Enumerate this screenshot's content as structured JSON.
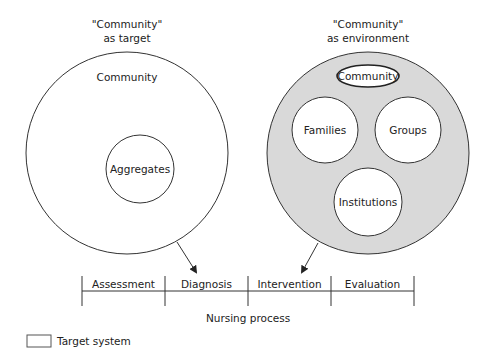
{
  "left_panel": {
    "heading_line1": "\"Community\"",
    "heading_line2": "as target",
    "outer_label": "Community",
    "inner_label": "Aggregates"
  },
  "right_panel": {
    "heading_line1": "\"Community\"",
    "heading_line2": "as environment",
    "community_label": "Community",
    "families_label": "Families",
    "groups_label": "Groups",
    "institutions_label": "Institutions",
    "fill_color": "#d9d9d9"
  },
  "process": {
    "stages": [
      "Assessment",
      "Diagnosis",
      "Intervention",
      "Evaluation"
    ],
    "caption": "Nursing process"
  },
  "legend": {
    "label": "Target system"
  }
}
